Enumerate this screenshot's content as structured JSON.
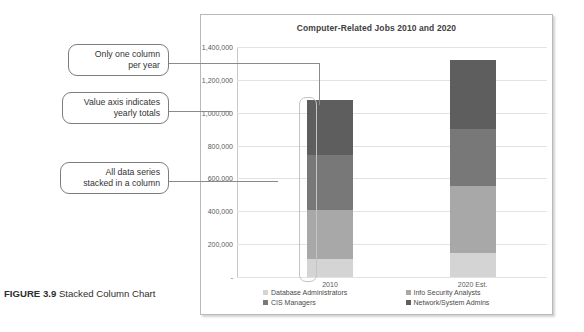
{
  "figure": {
    "label": "FIGURE 3.9",
    "caption": "Stacked Column Chart"
  },
  "callouts": [
    {
      "line1": "Only one column",
      "line2": "per year"
    },
    {
      "line1": "Value axis indicates",
      "line2": "yearly totals"
    },
    {
      "line1": "All data series",
      "line2": "stacked in a column"
    }
  ],
  "chart_data": {
    "type": "bar",
    "subtype": "stacked-column",
    "title": "Computer-Related Jobs 2010 and 2020",
    "xlabel": "",
    "ylabel": "",
    "categories": [
      "2010",
      "2020 Est."
    ],
    "ylim": [
      0,
      1400000
    ],
    "ytick_labels": [
      "-",
      "200,000",
      "400,000",
      "600,000",
      "800,000",
      "1,000,000",
      "1,200,000",
      "1,400,000"
    ],
    "ytick_values": [
      0,
      200000,
      400000,
      600000,
      800000,
      1000000,
      1200000,
      1400000
    ],
    "grid": true,
    "legend_position": "bottom",
    "series": [
      {
        "name": "Database Administrators",
        "values": [
          110000,
          145000
        ],
        "color": "#d4d4d4"
      },
      {
        "name": "Info Security Analysts",
        "values": [
          300000,
          410000
        ],
        "color": "#a8a8a8"
      },
      {
        "name": "CIS Managers",
        "values": [
          335000,
          345000
        ],
        "color": "#787878"
      },
      {
        "name": "Network/System Admins",
        "values": [
          335000,
          420000
        ],
        "color": "#5e5e5e"
      }
    ],
    "totals": [
      1080000,
      1320000
    ]
  }
}
